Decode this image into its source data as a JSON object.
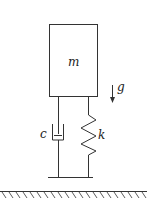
{
  "diagram": {
    "mass_label": "m",
    "damper_label": "c",
    "spring_label": "k",
    "gravity_label": "g",
    "line_color": "#333333"
  }
}
